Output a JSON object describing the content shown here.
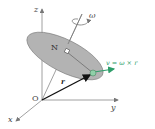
{
  "labels": {
    "z_axis": "z",
    "y_axis": "y",
    "x_axis": "x",
    "origin": "O",
    "omega": "ω",
    "normal_point": "N",
    "position_vector": "r",
    "velocity_eq": "v = ω × r"
  },
  "colors": {
    "disk_fill": "#b3b3b3",
    "velocity": "#2e9e6a",
    "axis": "#888888",
    "vector_r": "#111111",
    "point": "#8fcfa8"
  }
}
